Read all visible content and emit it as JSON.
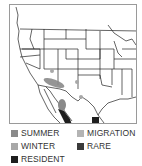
{
  "map": {
    "region": "Western North America range map",
    "colors": {
      "summer": "#8a8a8a",
      "winter": "#a8a8a8",
      "migration": "#b4b4b4",
      "rare": "#3a3a3a",
      "resident": "#1e1e1e",
      "border_lines": "#222222",
      "frame": "#9a9a9a"
    }
  },
  "legend": {
    "items": [
      {
        "key": "summer",
        "label": "SUMMER",
        "color": "#8a8a8a"
      },
      {
        "key": "migration",
        "label": "MIGRATION",
        "color": "#b4b4b4"
      },
      {
        "key": "winter",
        "label": "WINTER",
        "color": "#a8a8a8"
      },
      {
        "key": "rare",
        "label": "RARE",
        "color": "#3a3a3a"
      },
      {
        "key": "resident",
        "label": "RESIDENT",
        "color": "#1e1e1e"
      }
    ]
  }
}
